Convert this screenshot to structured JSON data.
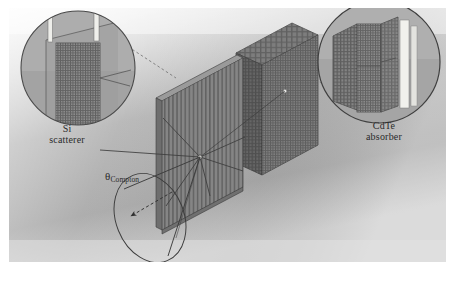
{
  "figure": {
    "kind": "compton-camera-schematic",
    "background_color": "#ffffff",
    "panel_color": "#a9a9a9",
    "ink_color": "#3a3a3a",
    "highlight_color": "#e8e8e4"
  },
  "labels": {
    "si": {
      "line1": "Si",
      "line2": "scatterer"
    },
    "cdte": {
      "line1": "CdTe",
      "line2": "absorber"
    },
    "theta": {
      "symbol": "θ",
      "subscript": "Compton"
    }
  },
  "insets": {
    "left": {
      "name": "si-scatterer-magnifier",
      "cx": 78,
      "cy": 68,
      "r": 57
    },
    "right": {
      "name": "cdte-absorber-magnifier",
      "cx": 379,
      "cy": 62,
      "r": 61
    }
  },
  "detectors": {
    "scatterer": {
      "name": "si-scatterer-plate",
      "strips": 22
    },
    "absorber": {
      "name": "cdte-absorber-slab",
      "cols": 26,
      "rows": 18
    }
  },
  "cone": {
    "name": "compton-cone",
    "apex_x": 200,
    "apex_y": 157,
    "ellipse_cx": 150,
    "ellipse_cy": 218,
    "rx": 34,
    "ry": 46,
    "rot": -22
  },
  "arrow": {
    "name": "scatter-direction-arrow",
    "x1": 172,
    "y1": 192,
    "x2": 131,
    "y2": 216
  }
}
